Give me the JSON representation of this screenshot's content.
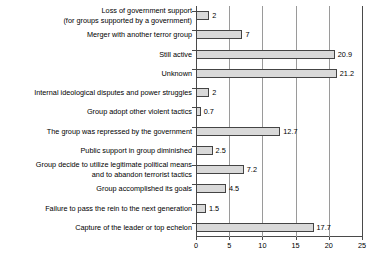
{
  "chart_data": {
    "type": "bar",
    "orientation": "horizontal",
    "title": "",
    "xlabel": "",
    "ylabel": "",
    "xlim": [
      0,
      25
    ],
    "xticks": [
      0,
      5,
      10,
      15,
      20,
      25
    ],
    "grid": "vertical",
    "legend": "none",
    "bar_color": "#d9d9d9",
    "bar_edge_color": "#444444",
    "categories": [
      "Loss of government support\n(for groups supported by a government)",
      "Merger with another terror group",
      "Still active",
      "Unknown",
      "Internal ideological disputes and power struggles",
      "Group adopt other violent tactics",
      "The group was repressed by the government",
      "Public support in group diminished",
      "Group decide to utilize legitimate political means\nand to abandon terrorist tactics",
      "Group accomplished its goals",
      "Failure to pass the rein to the next generation",
      "Capture of the leader or top echelon"
    ],
    "values": [
      2,
      7,
      20.9,
      21.2,
      2,
      0.7,
      12.7,
      2.5,
      7.2,
      4.5,
      1.5,
      17.7
    ],
    "value_labels": [
      "2",
      "7",
      "20.9",
      "21.2",
      "2",
      "0.7",
      "12.7",
      "2.5",
      "7.2",
      "4.5",
      "1.5",
      "17.7"
    ]
  }
}
